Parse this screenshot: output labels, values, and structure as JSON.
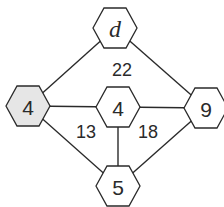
{
  "diagram": {
    "type": "hexagon-number-graph",
    "nodes": [
      {
        "id": "top",
        "label": "d",
        "italic": true,
        "shaded": false
      },
      {
        "id": "left",
        "label": "4",
        "italic": false,
        "shaded": true
      },
      {
        "id": "center",
        "label": "4",
        "italic": false,
        "shaded": false
      },
      {
        "id": "right",
        "label": "9",
        "italic": false,
        "shaded": false
      },
      {
        "id": "bottom",
        "label": "5",
        "italic": false,
        "shaded": false
      }
    ],
    "edges": [
      [
        "top",
        "left"
      ],
      [
        "top",
        "right"
      ],
      [
        "left",
        "center"
      ],
      [
        "center",
        "right"
      ],
      [
        "left",
        "bottom"
      ],
      [
        "center",
        "bottom"
      ],
      [
        "right",
        "bottom"
      ]
    ],
    "regions": [
      {
        "id": "upper",
        "label": "22"
      },
      {
        "id": "lower-left",
        "label": "13"
      },
      {
        "id": "lower-right",
        "label": "18"
      }
    ],
    "colors": {
      "stroke": "#2a2a2a",
      "shaded_fill": "#e6e6e6",
      "fill": "#ffffff"
    }
  }
}
